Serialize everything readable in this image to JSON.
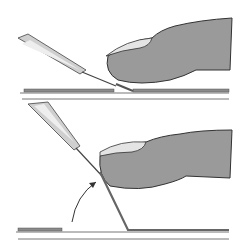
{
  "figure": {
    "panels": [
      {
        "id": "top",
        "state": "strip flat, tool tip near strip end"
      },
      {
        "id": "bottom",
        "state": "strip bent upward against fingertip, arrow shows lift"
      }
    ],
    "colors": {
      "finger_fill": "#9a9a9a",
      "nail_fill": "#e4e4e4",
      "outline": "#333333",
      "tool_fill": "#cfcfcf",
      "strip": "#7a7a7a",
      "background": "#ffffff"
    }
  }
}
